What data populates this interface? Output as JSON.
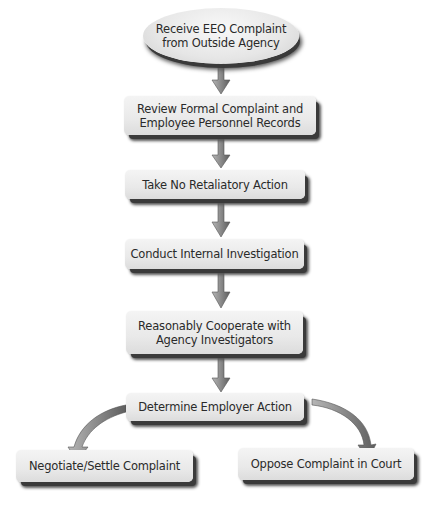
{
  "diagram": {
    "nodes": [
      {
        "id": "receive",
        "label": "Receive EEO  Complaint from Outside Agency",
        "line1": "Receive EEO  Complaint",
        "line2": "from Outside Agency",
        "shape": "ellipse"
      },
      {
        "id": "review",
        "label": "Review Formal Complaint and Employee Personnel Records",
        "line1": "Review Formal Complaint and",
        "line2": "Employee Personnel Records",
        "shape": "rounded-rect"
      },
      {
        "id": "no-retaliation",
        "label": "Take No Retaliatory Action",
        "shape": "rounded-rect"
      },
      {
        "id": "investigate",
        "label": "Conduct Internal Investigation",
        "shape": "rounded-rect"
      },
      {
        "id": "cooperate",
        "label": "Reasonably Cooperate with Agency Investigators",
        "line1": "Reasonably Cooperate with",
        "line2": "Agency Investigators",
        "shape": "rounded-rect"
      },
      {
        "id": "determine",
        "label": "Determine Employer Action",
        "shape": "rounded-rect"
      },
      {
        "id": "settle",
        "label": "Negotiate/Settle Complaint",
        "shape": "rounded-rect"
      },
      {
        "id": "oppose",
        "label": "Oppose Complaint in Court",
        "shape": "rounded-rect"
      }
    ],
    "edges": [
      {
        "from": "receive",
        "to": "review"
      },
      {
        "from": "review",
        "to": "no-retaliation"
      },
      {
        "from": "no-retaliation",
        "to": "investigate"
      },
      {
        "from": "investigate",
        "to": "cooperate"
      },
      {
        "from": "cooperate",
        "to": "determine"
      },
      {
        "from": "determine",
        "to": "settle"
      },
      {
        "from": "determine",
        "to": "oppose"
      }
    ],
    "colors": {
      "box_fill": "#ececec",
      "shadow": "#3a3a3a",
      "arrow": "#8c8c8c",
      "text": "#2a2a2a"
    }
  }
}
